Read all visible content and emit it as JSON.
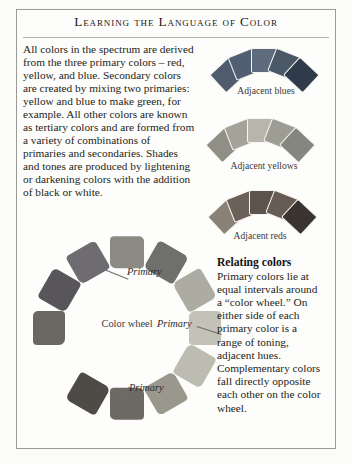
{
  "page": {
    "title": "Learning the Language of Color",
    "background_color": "#fbfbf9",
    "frame_color": "#9a9a96"
  },
  "intro": {
    "text": "All colors in the spectrum are derived from the three primary colors – red, yellow, and blue. Secondary colors are created by mixing two primaries: yellow and blue to make green, for example. All other colors are known as tertiary colors and are formed from a variety of combinations of primaries and secondaries. Shades and tones are produced by lightening or darkening colors with the addition of black or white."
  },
  "arcs": [
    {
      "id": "adjacent-blues",
      "caption": "Adjacent blues",
      "swatches": [
        "#4e5c6e",
        "#515f72",
        "#5d6b7d",
        "#4a5868",
        "#2f3a4a"
      ]
    },
    {
      "id": "adjacent-yellows",
      "caption": "Adjacent yellows",
      "swatches": [
        "#8f8f86",
        "#a3a39a",
        "#b6b6ad",
        "#9d9d94",
        "#868680"
      ]
    },
    {
      "id": "adjacent-reds",
      "caption": "Adjacent reds",
      "swatches": [
        "#8a8176",
        "#6b6159",
        "#5c534c",
        "#665c54",
        "#3a332f"
      ]
    }
  ],
  "wheel": {
    "center_label": "Color wheel",
    "primary_labels": [
      "Primary",
      "Primary",
      "Primary"
    ],
    "swatches": [
      "#8b8b84",
      "#6f6f6c",
      "#adaca2",
      "#c3c2b6",
      "#bdbcb0",
      "#9a988d",
      "#6d6a64",
      "#4e4b47",
      "#55525p",
      "#6a6762",
      "#58565a",
      "#6e6c70"
    ]
  },
  "relating": {
    "heading": "Relating colors",
    "body": "Primary colors lie at equal intervals around a “color wheel.” On either side of each primary color is a range of toning, adjacent hues. Complementary colors fall directly opposite each other on the color wheel."
  }
}
